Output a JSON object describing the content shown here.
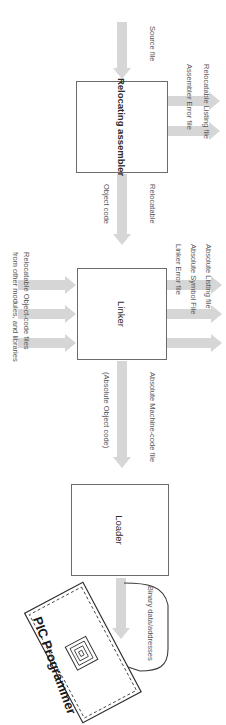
{
  "figure": {
    "orientation": "rotated-90-clockwise",
    "colors": {
      "arrow": "#d6d6d6",
      "box_border": "#6b6b6b",
      "label_text": "#575757",
      "heading_text": "#1a1a1a",
      "background": "#ffffff"
    }
  },
  "boxes": [
    {
      "id": "relocating-assembler",
      "label": "Relocating assembler",
      "bold": true
    },
    {
      "id": "linker",
      "label": "Linker",
      "bold": false
    },
    {
      "id": "loader",
      "label": "Loader",
      "bold": false
    }
  ],
  "flow_labels": {
    "source_file": "Source file",
    "relocatable": "Relocatable",
    "object_code": "Object code",
    "absolute_machine_code": "Absolute Machine-code file",
    "absolute_object_code": "(Absolute Object code)",
    "binary_data_addresses": "Binary data/addresses"
  },
  "assembler_outputs": [
    "Relocatable Listing file",
    "Assembler Error file"
  ],
  "linker_outputs": [
    "Absolute Listing file",
    "Absolute Symbol File",
    "Linker Error file"
  ],
  "linker_inputs": {
    "line1": "Relocatable Object-code files",
    "line2": "from other modules, and libraries"
  },
  "device": {
    "name": "PIC Programmer",
    "chip_icon": "chip-socket-icon"
  },
  "caption": {
    "text": "",
    "partial": true
  }
}
